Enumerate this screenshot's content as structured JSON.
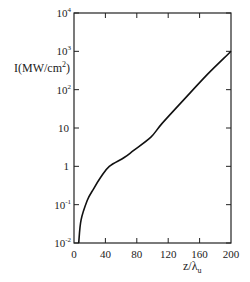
{
  "chart_data": {
    "type": "line",
    "title": "",
    "xlabel": "z/λu",
    "ylabel": "I(MW/cm²)",
    "xscale": "linear",
    "yscale": "log",
    "xlim": [
      0,
      200
    ],
    "ylim": [
      0.01,
      10000
    ],
    "grid": false,
    "legend": null,
    "x_ticks": [
      "0",
      "40",
      "80",
      "120",
      "160",
      "200"
    ],
    "y_ticks": [
      "10⁻²",
      "10⁻¹",
      "1",
      "10",
      "10²",
      "10³",
      "10⁴"
    ],
    "series": [
      {
        "name": "I",
        "x": [
          6,
          9,
          17,
          25,
          34,
          45,
          64,
          76,
          98,
          112,
          140,
          170,
          200
        ],
        "y": [
          0.01,
          0.04,
          0.13,
          0.26,
          0.52,
          1.0,
          1.7,
          2.6,
          5.8,
          13,
          55,
          250,
          1000
        ]
      }
    ]
  },
  "labels": {
    "ylabel_main": "I(MW/cm",
    "ylabel_sup": "2",
    "ylabel_end": ")",
    "xlabel_main": "z/λ",
    "xlabel_sub": "u"
  },
  "ticks": {
    "x": [
      "0",
      "40",
      "80",
      "120",
      "160",
      "200"
    ],
    "y": [
      {
        "base": "10",
        "exp": "4"
      },
      {
        "base": "10",
        "exp": "3"
      },
      {
        "base": "10",
        "exp": "2"
      },
      {
        "base": "10",
        "exp": ""
      },
      {
        "base": "1",
        "exp": ""
      },
      {
        "base": "10",
        "exp": "-1"
      },
      {
        "base": "10",
        "exp": "-2"
      }
    ]
  }
}
